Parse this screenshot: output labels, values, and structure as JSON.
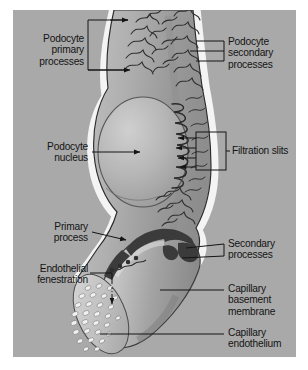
{
  "figure": {
    "panel_background": "#a9a9a9",
    "page_background": "#ffffff",
    "ink_color": "#141414",
    "width": 308,
    "height": 370
  },
  "labels": [
    {
      "id": "podocyte-primary-processes",
      "text": "Podocyte\nprimary\nprocesses",
      "align": "right",
      "x": 8,
      "y": 33,
      "width": 76,
      "connector": "bracket-box-right"
    },
    {
      "id": "podocyte-secondary-processes",
      "text": "Podocyte\nsecondary\nprocesses",
      "align": "left",
      "x": 228,
      "y": 36,
      "width": 74,
      "connector": "bracket-three-lines-left"
    },
    {
      "id": "podocyte-nucleus",
      "text": "Podocyte\nnucleus",
      "align": "right",
      "x": 30,
      "y": 141,
      "width": 58,
      "connector": "arrow-right"
    },
    {
      "id": "filtration-slits",
      "text": "Filtration slits",
      "align": "left",
      "x": 230,
      "y": 145,
      "width": 72,
      "connector": "bracket-box-four-arrows-left"
    },
    {
      "id": "primary-process",
      "text": "Primary\nprocess",
      "align": "right",
      "x": 30,
      "y": 220,
      "width": 58,
      "connector": "arrow-right"
    },
    {
      "id": "secondary-processes",
      "text": "Secondary\nprocesses",
      "align": "left",
      "x": 228,
      "y": 238,
      "width": 74,
      "connector": "bracket-two-lines-left"
    },
    {
      "id": "endothelial-fenestration",
      "text": "Endothelial\nfenestration",
      "align": "right",
      "x": 14,
      "y": 263,
      "width": 72,
      "connector": "elbow-down-arrow"
    },
    {
      "id": "capillary-basement-membrane",
      "text": "Capillary\nbasement\nmembrane",
      "align": "left",
      "x": 228,
      "y": 282,
      "width": 74,
      "connector": "leader-line-left"
    },
    {
      "id": "capillary-endothelium",
      "text": "Capillary\nendothelium",
      "align": "left",
      "x": 228,
      "y": 327,
      "width": 74,
      "connector": "leader-line-left"
    }
  ],
  "structures": {
    "podocyte_body": {
      "name": "podocyte-cell-body",
      "fill_light": "#b8b8b8",
      "fill_mid": "#a0a0a0",
      "fill_dark": "#8a8a8a",
      "outline": "#2a2a2a",
      "halo": "#f2f2f2"
    },
    "nucleus": {
      "name": "podocyte-nucleus-shape",
      "fill_light": "#c6c6c6",
      "fill_dark": "#9a9a9a",
      "outline": "#4a4a4a"
    },
    "secondary_processes": {
      "name": "secondary-process-fingers",
      "stroke": "#2f2f2f",
      "count": 34
    },
    "filtration_slits": {
      "name": "filtration-slit-zigzag",
      "stroke": "#2a2a2a",
      "count": 9
    },
    "capillary": {
      "name": "capillary-tube",
      "fill_light": "#cfcfcf",
      "fill_mid": "#a8a8a8",
      "fill_dark": "#8c8c8c",
      "outline": "#3a3a3a"
    },
    "fenestrated_face": {
      "name": "fenestrated-endothelium-face",
      "fill": "#c9c9c9",
      "pore_fill": "#f0f0f0",
      "pore_shadow": "#6f6f6f",
      "pore_count": 38
    },
    "foot_processes": {
      "name": "interdigitating-foot-processes",
      "fill": "#3b3b3b"
    }
  }
}
